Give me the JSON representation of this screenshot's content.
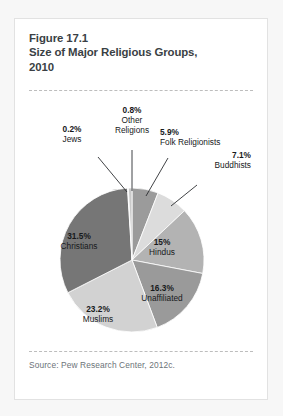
{
  "card": {
    "title_line1": "Figure 17.1",
    "title_line2": "Size of Major Religious Groups,",
    "title_line3": "2010",
    "source": "Source: Pew Research Center, 2012c."
  },
  "chart_data": {
    "type": "pie",
    "title": "Size of Major Religious Groups, 2010",
    "subtitle": "Figure 17.1",
    "source": "Source: Pew Research Center, 2012c.",
    "units": "percent",
    "legend": "none",
    "labels_inside_slices": [
      "Christians",
      "Muslims",
      "Unaffiliated",
      "Hindus"
    ],
    "labels_with_leader_lines": [
      "Buddhists",
      "Folk Religionists",
      "Other Religions",
      "Jews"
    ],
    "start_angle_deg": 0,
    "direction": "clockwise",
    "categories": [
      "Folk Religionists",
      "Buddhists",
      "Hindus",
      "Unaffiliated",
      "Muslims",
      "Christians",
      "Jews",
      "Other Religions"
    ],
    "values": [
      5.9,
      7.1,
      15,
      16.3,
      23.2,
      31.5,
      0.2,
      0.8
    ],
    "value_labels": [
      "5.9%",
      "7.1%",
      "15%",
      "16.3%",
      "23.2%",
      "31.5%",
      "0.2%",
      "0.8%"
    ],
    "colors": [
      "#9b9b9b",
      "#dcdcdc",
      "#b3b3b3",
      "#9a9a9a",
      "#d2d2d2",
      "#767676",
      "#ffffff",
      "#c9c9c9"
    ],
    "slices": [
      {
        "name": "Folk Religionists",
        "value": 5.9,
        "value_label": "5.9%",
        "color": "#9b9b9b"
      },
      {
        "name": "Buddhists",
        "value": 7.1,
        "value_label": "7.1%",
        "color": "#dcdcdc"
      },
      {
        "name": "Hindus",
        "value": 15,
        "value_label": "15%",
        "color": "#b3b3b3"
      },
      {
        "name": "Unaffiliated",
        "value": 16.3,
        "value_label": "16.3%",
        "color": "#9a9a9a"
      },
      {
        "name": "Muslims",
        "value": 23.2,
        "value_label": "23.2%",
        "color": "#d2d2d2"
      },
      {
        "name": "Christians",
        "value": 31.5,
        "value_label": "31.5%",
        "color": "#767676"
      },
      {
        "name": "Jews",
        "value": 0.2,
        "value_label": "0.2%",
        "color": "#ffffff"
      },
      {
        "name": "Other Religions",
        "value": 0.8,
        "value_label": "0.8%",
        "color": "#c9c9c9"
      }
    ]
  },
  "labels": {
    "other_religions": {
      "pct": "0.8%",
      "name": "Other",
      "name2": "Religions"
    },
    "jews": {
      "pct": "0.2%",
      "name": "Jews"
    },
    "folk": {
      "pct": "5.9%",
      "name": "Folk Religionists"
    },
    "buddhists": {
      "pct": "7.1%",
      "name": "Buddhists"
    },
    "hindus": {
      "pct": "15%",
      "name": "Hindus"
    },
    "unaffiliated": {
      "pct": "16.3%",
      "name": "Unaffiliated"
    },
    "muslims": {
      "pct": "23.2%",
      "name": "Muslims"
    },
    "christians": {
      "pct": "31.5%",
      "name": "Christians"
    }
  }
}
